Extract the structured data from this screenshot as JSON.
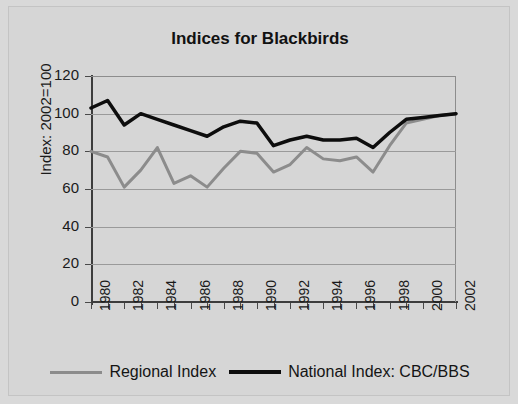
{
  "figure": {
    "background_color": "#d6d6d6",
    "plot_background_color": "#d6d6d6"
  },
  "chart_data": {
    "type": "line",
    "title": "Indices for Blackbirds",
    "xlabel": "",
    "ylabel": "Index: 2002=100",
    "ylim": [
      0,
      120
    ],
    "yticks": [
      0,
      20,
      40,
      60,
      80,
      100,
      120
    ],
    "xlim": [
      1980,
      2002
    ],
    "xticks": [
      1980,
      1981,
      1982,
      1983,
      1984,
      1985,
      1986,
      1987,
      1988,
      1989,
      1990,
      1991,
      1992,
      1993,
      1994,
      1995,
      1996,
      1997,
      1998,
      1999,
      2000,
      2001,
      2002
    ],
    "xtick_labels": [
      "1980",
      "1982",
      "1984",
      "1986",
      "1988",
      "1990",
      "1992",
      "1994",
      "1996",
      "1998",
      "2000",
      "2002"
    ],
    "xtick_labels_shown_every": 2,
    "grid": "horizontal",
    "legend_position": "bottom",
    "x": [
      1980,
      1981,
      1982,
      1983,
      1984,
      1985,
      1986,
      1987,
      1988,
      1989,
      1990,
      1991,
      1992,
      1993,
      1994,
      1995,
      1996,
      1997,
      1998,
      1999,
      2000,
      2001,
      2002
    ],
    "series": [
      {
        "name": "Regional Index",
        "color": "#8c8c8c",
        "line_width": 3,
        "values": [
          80,
          77,
          61,
          70,
          82,
          63,
          67,
          61,
          71,
          80,
          79,
          69,
          73,
          82,
          76,
          75,
          77,
          69,
          83,
          95,
          97,
          99,
          100
        ]
      },
      {
        "name": "National Index: CBC/BBS",
        "color": "#0d0d0d",
        "line_width": 3.5,
        "values": [
          103,
          107,
          94,
          100,
          97,
          94,
          91,
          88,
          93,
          96,
          95,
          83,
          86,
          88,
          86,
          86,
          87,
          82,
          90,
          97,
          98,
          99,
          100
        ]
      }
    ]
  },
  "legend": {
    "entries": [
      {
        "label": "Regional Index"
      },
      {
        "label": "National Index: CBC/BBS"
      }
    ]
  }
}
